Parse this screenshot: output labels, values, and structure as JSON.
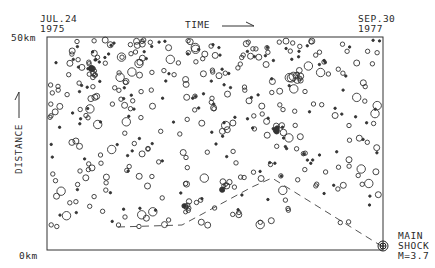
{
  "chart_data": {
    "type": "scatter",
    "title": "",
    "xlabel": "TIME",
    "ylabel": "DISTANCE",
    "x_start_label": [
      "JUL.24",
      "1975"
    ],
    "x_end_label": [
      "SEP.30",
      "1977"
    ],
    "y_top_label": "50km",
    "y_bottom_label": "0km",
    "ylim": [
      0,
      50
    ],
    "xlim": [
      "1975-07-24",
      "1977-09-30"
    ],
    "grid": false,
    "annotation": [
      "MAIN",
      "SHOCK",
      "M=3.7"
    ],
    "main_shock": {
      "x_frac": 1.0,
      "distance_km": 0.5,
      "magnitude": 3.7
    },
    "migration_path_frac": [
      [
        0.21,
        0.11
      ],
      [
        0.4,
        0.12
      ],
      [
        0.61,
        0.31
      ],
      [
        0.67,
        0.34
      ],
      [
        1.0,
        0.01
      ]
    ],
    "marker_description": "open circles sized by magnitude; small filled dots for smallest events"
  },
  "labels": {
    "start_date": "JUL.24",
    "start_year": "1975",
    "end_date": "SEP.30",
    "end_year": "1977",
    "time": "TIME",
    "distance": "DISTANCE",
    "top": "50km",
    "bottom": "0km",
    "main": "MAIN",
    "shock": "SHOCK",
    "mag": "M=3.7"
  }
}
